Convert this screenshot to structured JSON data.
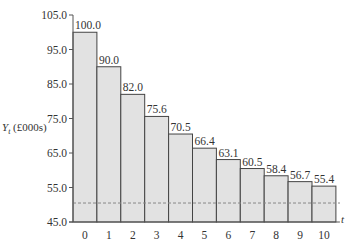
{
  "chart_data": {
    "type": "bar",
    "title": "",
    "xlabel": "t",
    "ylabel": "Y_t (£000s)",
    "ylabel_main": "Y",
    "ylabel_sub": "t",
    "ylabel_unit": "(£000s)",
    "categories": [
      "0",
      "1",
      "2",
      "3",
      "4",
      "5",
      "6",
      "7",
      "8",
      "9",
      "10"
    ],
    "values": [
      100.0,
      90.0,
      82.0,
      75.6,
      70.5,
      66.4,
      63.1,
      60.5,
      58.4,
      56.7,
      55.4
    ],
    "value_labels": [
      "100.0",
      "90.0",
      "82.0",
      "75.6",
      "70.5",
      "66.4",
      "63.1",
      "60.5",
      "58.4",
      "56.7",
      "55.4"
    ],
    "ylim": [
      45.0,
      105.0
    ],
    "yticks": [
      45.0,
      55.0,
      65.0,
      75.0,
      85.0,
      95.0,
      105.0
    ],
    "ytick_labels": [
      "45.0",
      "55.0",
      "65.0",
      "75.0",
      "85.0",
      "95.0",
      "105.0"
    ],
    "reference_line": {
      "value": 50.5,
      "style": "dashed"
    },
    "grid": false,
    "legend": null,
    "colors": {
      "bar_fill": "#e2e2e2",
      "bar_edge": "#444444",
      "axis": "#555555",
      "dashed": "#888888"
    }
  }
}
